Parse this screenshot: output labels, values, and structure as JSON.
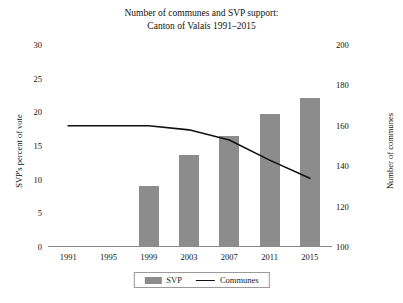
{
  "chart_data": {
    "type": "bar",
    "title": "Number of communes and SVP support: Canton of Valais 1991–2015",
    "title_line1": "Number of communes and SVP support:",
    "title_line2": "Canton of Valais 1991–2015",
    "categories": [
      "1991",
      "1995",
      "1999",
      "2003",
      "2007",
      "2011",
      "2015"
    ],
    "xlabel": "",
    "grid": false,
    "legend_position": "bottom",
    "series": [
      {
        "name": "SVP",
        "type": "bar",
        "axis": "left",
        "color": "#8c8c8c",
        "values": [
          null,
          null,
          9.1,
          13.6,
          16.5,
          19.8,
          22.1
        ]
      },
      {
        "name": "Communes",
        "type": "line",
        "axis": "right",
        "color": "#111111",
        "values": [
          160,
          160,
          160,
          158,
          153,
          143,
          134
        ]
      }
    ],
    "axes": {
      "left": {
        "label": "SVP's percent of vote",
        "ticks": [
          "30",
          "25",
          "20",
          "15",
          "10",
          "5",
          "0"
        ],
        "tick_values": [
          30,
          25,
          20,
          15,
          10,
          5,
          0
        ],
        "ylim": [
          0,
          30
        ]
      },
      "right": {
        "label": "Number of communes",
        "ticks": [
          "200",
          "180",
          "160",
          "140",
          "120",
          "100"
        ],
        "tick_values": [
          200,
          180,
          160,
          140,
          120,
          100
        ],
        "ylim": [
          100,
          200
        ]
      }
    }
  },
  "legend": {
    "items": [
      {
        "label": "SVP"
      },
      {
        "label": "Communes"
      }
    ]
  }
}
